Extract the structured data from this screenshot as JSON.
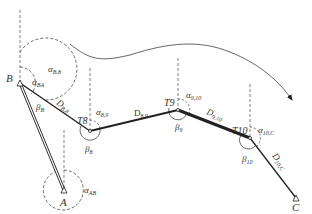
{
  "diagram": {
    "type": "traverse-survey",
    "points": {
      "B": {
        "label": "B",
        "x": 20,
        "y": 83
      },
      "A": {
        "label": "A",
        "x": 64,
        "y": 190
      },
      "T8": {
        "label": "T8",
        "x": 90,
        "y": 131
      },
      "T9": {
        "label": "T9",
        "x": 178,
        "y": 110
      },
      "T10": {
        "label": "T10",
        "x": 250,
        "y": 138
      },
      "C": {
        "label": "C",
        "x": 296,
        "y": 198
      }
    },
    "angles": {
      "alpha_B8": {
        "sym": "α",
        "sub": "B,8"
      },
      "alpha_BA": {
        "sym": "α",
        "sub": "BA"
      },
      "beta_B": {
        "sym": "β",
        "sub": "B"
      },
      "alpha_AB": {
        "sym": "α",
        "sub": "AB"
      },
      "alpha_89": {
        "sym": "α",
        "sub": "8,9"
      },
      "beta_8": {
        "sym": "β",
        "sub": "8"
      },
      "alpha_910": {
        "sym": "α",
        "sub": "9,10"
      },
      "beta_9": {
        "sym": "β",
        "sub": "9"
      },
      "alpha_10C": {
        "sym": "α",
        "sub": "10,C"
      },
      "beta_10": {
        "sym": "β",
        "sub": "10"
      }
    },
    "distances": {
      "D_B8": {
        "sym": "D",
        "sub": "B,8"
      },
      "D_89": {
        "sym": "D",
        "sub": "8,9"
      },
      "D_910": {
        "sym": "D",
        "sub": "9,10"
      },
      "D_10C": {
        "sym": "D",
        "sub": "10,C"
      }
    },
    "colors": {
      "line": "#222222",
      "dashed": "#555555",
      "curve": "#555555"
    }
  }
}
